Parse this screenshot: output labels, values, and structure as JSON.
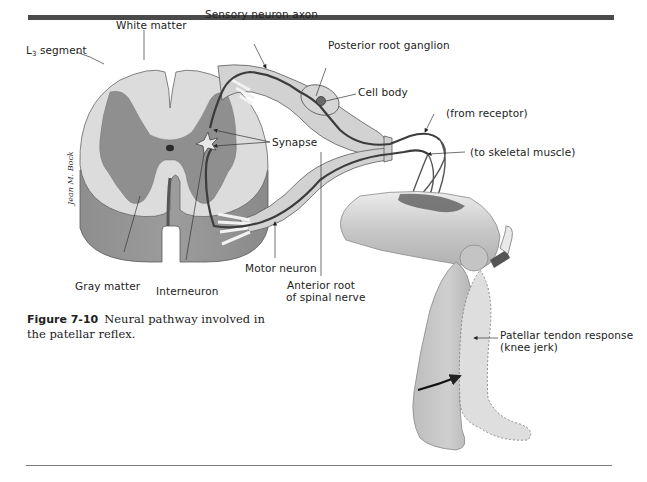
{
  "figure": {
    "number": "Figure 7-10",
    "caption": "Neural pathway involved in the patellar reflex.",
    "artist_signature": "Jean M. Bock"
  },
  "labels": {
    "white_matter": "White matter",
    "l3_segment_main": "L",
    "l3_segment_sub": "3",
    "l3_segment_rest": " segment",
    "sensory_neuron_axon": "Sensory neuron axon",
    "posterior_root_ganglion": "Posterior root ganglion",
    "cell_body": "Cell body",
    "from_receptor": "(from receptor)",
    "synapse": "Synapse",
    "to_skeletal_muscle": "(to skeletal muscle)",
    "gray_matter": "Gray matter",
    "interneuron": "Interneuron",
    "motor_neuron": "Motor neuron",
    "anterior_root_line1": "Anterior root",
    "anterior_root_line2": "of spinal nerve",
    "patellar_response_line1": "Patellar tendon response",
    "patellar_response_line2": "(knee jerk)"
  },
  "colors": {
    "rule": "#4a4a4a",
    "white_matter": "#d9d9d9",
    "gray_matter": "#8c8c8c",
    "nerve_fill": "#cfcfcf",
    "neuron_line": "#3c3c3c",
    "leg_fill": "#c8c8c8"
  }
}
